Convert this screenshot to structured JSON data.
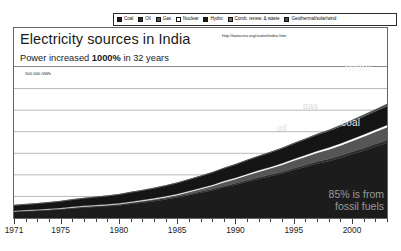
{
  "legend": {
    "items": [
      {
        "label": "Coal",
        "color": "#1c1c1c",
        "icon": "legend-swatch"
      },
      {
        "label": "Oil",
        "color": "#2e2e2e",
        "icon": "legend-swatch"
      },
      {
        "label": "Gas",
        "color": "#555555",
        "icon": "legend-swatch"
      },
      {
        "label": "Nuclear",
        "color": "#ffffff",
        "icon": "legend-swatch"
      },
      {
        "label": "Hydro",
        "color": "#1c1c1c",
        "icon": "legend-swatch"
      },
      {
        "label": "Comb. renew. & waste",
        "color": "#6e6e6e",
        "icon": "legend-swatch"
      },
      {
        "label": "Geothermal/solar/wind",
        "color": "#4a4a4a",
        "icon": "legend-swatch"
      }
    ]
  },
  "header": {
    "title": "Electricity sources in India",
    "source_url": "http://www.iea.org/statist/index.htm",
    "subtitle_prefix": "Power increased ",
    "subtitle_emphasis": "1000%",
    "subtitle_suffix": " in 32 years"
  },
  "annotations": {
    "hydro": "hydro",
    "gas": "gas",
    "oil": "oil",
    "coal": "coal",
    "fossil_note_line1": "85% is from",
    "fossil_note_line2": "fossil fuels",
    "gridline_label": "500 000 GWh"
  },
  "chart_data": {
    "type": "area",
    "title": "Electricity sources in India",
    "subtitle": "Power increased 1000% in 32 years",
    "xlabel": "",
    "ylabel": "GWh",
    "grid": true,
    "legend_position": "top",
    "xlim": [
      1971,
      2003
    ],
    "ylim": [
      0,
      700000
    ],
    "gridline_values": [
      100000,
      200000,
      300000,
      400000,
      500000,
      600000
    ],
    "labeled_gridline": 500000,
    "tick_labels": [
      "1971",
      "1975",
      "1980",
      "1985",
      "1990",
      "1995",
      "2000"
    ],
    "tick_values": [
      1971,
      1975,
      1980,
      1985,
      1990,
      1995,
      2000
    ],
    "x": [
      1971,
      1972,
      1973,
      1974,
      1975,
      1976,
      1977,
      1978,
      1979,
      1980,
      1981,
      1982,
      1983,
      1984,
      1985,
      1986,
      1987,
      1988,
      1989,
      1990,
      1991,
      1992,
      1993,
      1994,
      1995,
      1996,
      1997,
      1998,
      1999,
      2000,
      2001,
      2002,
      2003
    ],
    "series": [
      {
        "name": "Coal",
        "color": "#1c1c1c",
        "values": [
          28000,
          31000,
          33000,
          36000,
          39000,
          44000,
          48000,
          51000,
          54000,
          58000,
          65000,
          71000,
          78000,
          86000,
          95000,
          106000,
          117000,
          128000,
          142000,
          154000,
          168000,
          181000,
          193000,
          206000,
          222000,
          236000,
          251000,
          263000,
          278000,
          295000,
          312000,
          330000,
          348000
        ]
      },
      {
        "name": "Oil",
        "color": "#2e2e2e",
        "values": [
          3000,
          3200,
          3400,
          3600,
          3800,
          4000,
          4200,
          4300,
          4400,
          4600,
          4800,
          5000,
          5200,
          5400,
          5600,
          5800,
          6100,
          6400,
          6700,
          7000,
          7400,
          7800,
          8200,
          8700,
          9200,
          9800,
          10400,
          11000,
          11600,
          12200,
          12800,
          13400,
          14000
        ]
      },
      {
        "name": "Gas",
        "color": "#555555",
        "values": [
          300,
          400,
          500,
          600,
          700,
          900,
          1100,
          1400,
          1700,
          2000,
          2500,
          3200,
          4000,
          5000,
          6500,
          8500,
          11000,
          14000,
          17000,
          20000,
          23000,
          26000,
          29000,
          32000,
          35000,
          38000,
          41000,
          44000,
          47000,
          50000,
          53000,
          56000,
          59000
        ]
      },
      {
        "name": "Nuclear",
        "color": "#ffffff",
        "values": [
          2400,
          2500,
          2600,
          2700,
          2800,
          3000,
          3100,
          3200,
          3300,
          3400,
          3600,
          3800,
          4000,
          4200,
          4400,
          4600,
          4800,
          5100,
          5400,
          5700,
          6000,
          6300,
          6600,
          7000,
          7400,
          7800,
          8200,
          8600,
          9000,
          9400,
          9800,
          10200,
          10600
        ]
      },
      {
        "name": "Hydro",
        "color": "#151515",
        "values": [
          25000,
          26000,
          27500,
          29000,
          31000,
          33000,
          35000,
          37000,
          39000,
          41000,
          43000,
          45000,
          47000,
          49000,
          51000,
          53000,
          55000,
          57000,
          59000,
          61000,
          63000,
          65000,
          67000,
          69000,
          71000,
          73000,
          75000,
          77000,
          79000,
          81000,
          83000,
          85000,
          87000
        ]
      },
      {
        "name": "Comb. renew. & waste",
        "color": "#6e6e6e",
        "values": [
          0,
          0,
          0,
          0,
          0,
          0,
          0,
          0,
          0,
          0,
          0,
          0,
          0,
          0,
          100,
          200,
          300,
          400,
          500,
          600,
          700,
          800,
          900,
          1000,
          1100,
          1200,
          1300,
          1400,
          1500,
          1600,
          1700,
          1800,
          1900
        ]
      },
      {
        "name": "Geothermal/solar/wind",
        "color": "#4a4a4a",
        "values": [
          0,
          0,
          0,
          0,
          0,
          0,
          0,
          0,
          0,
          0,
          0,
          0,
          0,
          0,
          0,
          0,
          0,
          0,
          0,
          100,
          200,
          400,
          700,
          1000,
          1400,
          1900,
          2500,
          3200,
          4000,
          4900,
          5900,
          7000,
          8200
        ]
      }
    ]
  }
}
